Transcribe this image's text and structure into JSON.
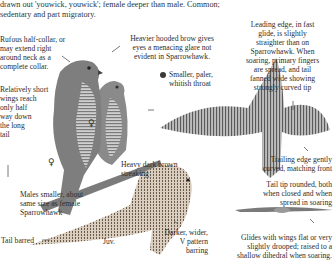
{
  "intro": {
    "line1": "drawn out 'youwick, youwick'; female deeper than male. Common;",
    "line2": "sedentary and part migratory."
  },
  "annotations": {
    "collar": [
      "Rufous half-collar, or",
      "may extend right",
      "around neck as a",
      "complete collar."
    ],
    "brow": [
      "Heavier hooded brow gives",
      "eyes a menacing glare not",
      "evident in Sparrowhawk."
    ],
    "throat": [
      "Smaller, paler,",
      "whitish throat"
    ],
    "leading_edge": [
      "Leading edge, in fast",
      "glide, is slightly",
      "straighter than on",
      "Sparrowhawk. When",
      "soaring, primary fingers",
      "are spread, and tail",
      "fanned wide showing",
      "strongly curved tip"
    ],
    "wings_short": [
      "Relatively short",
      "wings reach",
      "only half",
      "way down",
      "the long",
      "tail"
    ],
    "streaking": [
      "Heavy dark brown",
      "streaking"
    ],
    "trailing_edge": [
      "Trailing edge gently",
      "curved, matching front"
    ],
    "males": [
      "Males smaller, about",
      "same size as female",
      "Sparrowhawk"
    ],
    "tail_tip": [
      "Tail tip rounded, both",
      "when closed and when",
      "spread in soaring"
    ],
    "tail_barred": "Tail barred",
    "juv_left": "Juv.",
    "v_pattern": [
      "Darker, wider,",
      "V pattern",
      "barring"
    ],
    "glides": [
      "Glides with wings flat or very",
      "slightly drooped; raised to a",
      "shallow dihedral when soaring."
    ]
  },
  "symbols": {
    "female_1": "♀",
    "female_2": "♀",
    "male_dot": "●"
  },
  "colors": {
    "text": "#2d2d2d",
    "background": "#ffffff",
    "illustration": "#6e6e6e"
  }
}
